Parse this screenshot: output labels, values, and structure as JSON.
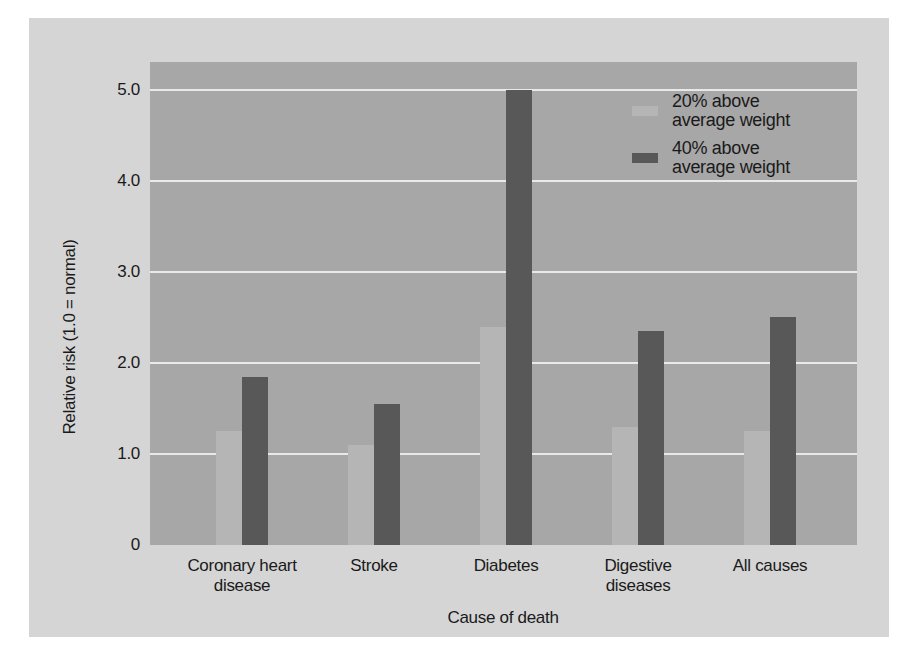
{
  "chart_data": {
    "type": "bar",
    "title": "",
    "categories": [
      "Coronary heart disease",
      "Stroke",
      "Diabetes",
      "Digestive diseases",
      "All causes"
    ],
    "series": [
      {
        "name": "20% above average weight",
        "color": "#b5b5b5",
        "values": [
          1.25,
          1.1,
          2.4,
          1.3,
          1.25
        ]
      },
      {
        "name": "40% above average weight",
        "color": "#585858",
        "values": [
          1.85,
          1.55,
          5.0,
          2.35,
          2.5
        ]
      }
    ],
    "xlabel": "Cause of death",
    "ylabel": "Relative risk (1.0 = normal)",
    "ylim": [
      0,
      5.3
    ],
    "yticks": [
      {
        "value": 0,
        "label": "0"
      },
      {
        "value": 1,
        "label": "1.0"
      },
      {
        "value": 2,
        "label": "2.0"
      },
      {
        "value": 3,
        "label": "3.0"
      },
      {
        "value": 4,
        "label": "4.0"
      },
      {
        "value": 5,
        "label": "5.0"
      }
    ],
    "grid": true,
    "legend_position": "top-right"
  },
  "style": {
    "page_background": "#ffffff",
    "panel_background": "#d5d5d5",
    "plot_background": "#a7a7a7",
    "gridline_color": "#e9e9e9",
    "text_color": "#1a1a1a"
  }
}
